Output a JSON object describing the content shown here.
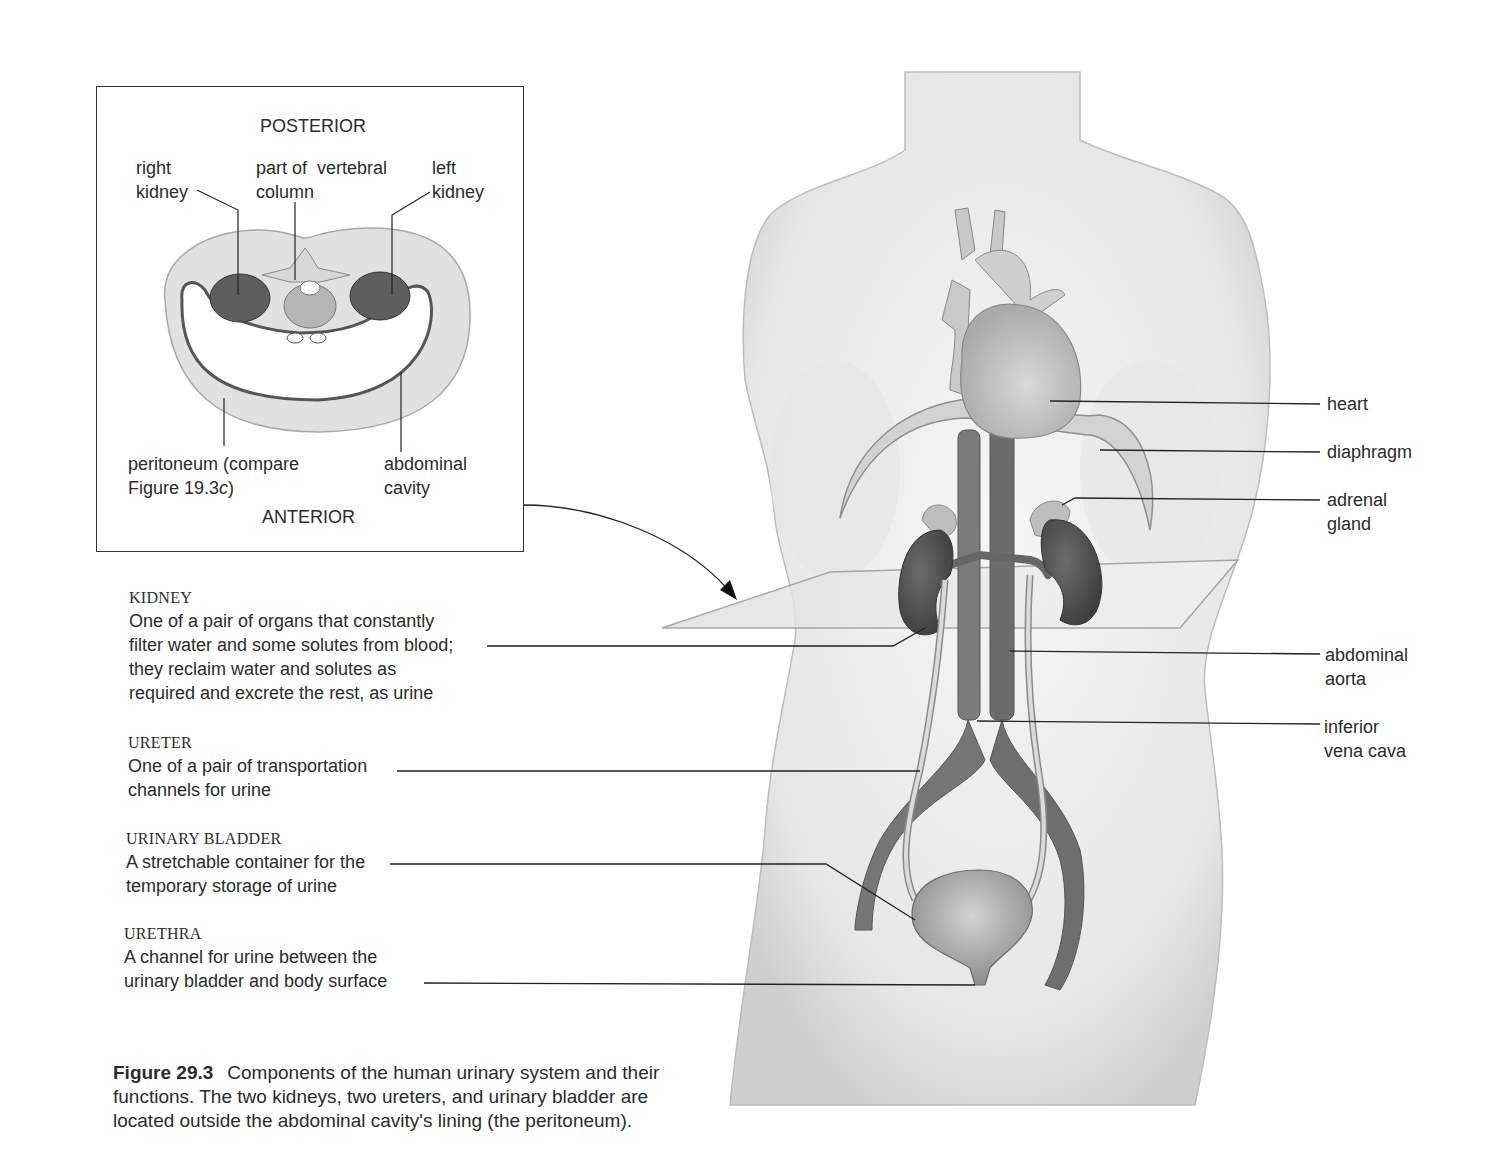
{
  "inset": {
    "top_label": "POSTERIOR",
    "bottom_label": "ANTERIOR",
    "labels": {
      "right_kidney": [
        "right",
        "kidney"
      ],
      "vertebral_column": [
        "part of  vertebral",
        "column"
      ],
      "left_kidney": [
        "left",
        "kidney"
      ],
      "peritoneum": [
        "peritoneum (compare",
        "Figure 19.3"
      ],
      "peritoneum_suffix_italic": "c",
      "peritoneum_close": ")",
      "abdominal_cavity": [
        "abdominal",
        "cavity"
      ]
    }
  },
  "descriptions": [
    {
      "heading": "KIDNEY",
      "lines": [
        "One of a pair of organs that constantly",
        "filter water and some solutes from blood;",
        "they reclaim water and solutes as",
        "required and excrete the rest, as urine"
      ]
    },
    {
      "heading": "URETER",
      "lines": [
        "One of a pair of transportation",
        "channels for urine"
      ]
    },
    {
      "heading": "URINARY BLADDER",
      "lines": [
        "A stretchable container for the",
        "temporary storage of urine"
      ]
    },
    {
      "heading": "URETHRA",
      "lines": [
        "A channel for urine between the",
        "urinary bladder and body surface"
      ]
    }
  ],
  "right_labels": [
    {
      "name": "heart",
      "lines": [
        "heart"
      ]
    },
    {
      "name": "diaphragm",
      "lines": [
        "diaphragm"
      ]
    },
    {
      "name": "adrenal-gland",
      "lines": [
        "adrenal",
        "gland"
      ]
    },
    {
      "name": "abdominal-aorta",
      "lines": [
        "abdominal",
        "aorta"
      ]
    },
    {
      "name": "inferior-vena-cava",
      "lines": [
        "inferior",
        "vena cava"
      ]
    }
  ],
  "caption": {
    "figure_number": "Figure 29.3",
    "lines": [
      "Components of the human urinary system and their",
      "functions. The two kidneys, two ureters, and urinary bladder are",
      "located outside the abdominal cavity's lining (the peritoneum)."
    ]
  },
  "colors": {
    "body_fill": "#ededed",
    "body_edge": "#b8b8b8",
    "organ_dark": "#5a5a5a",
    "vessel": "#7a7a7a",
    "ureter": "#cfcfcf",
    "line": "#222222"
  }
}
